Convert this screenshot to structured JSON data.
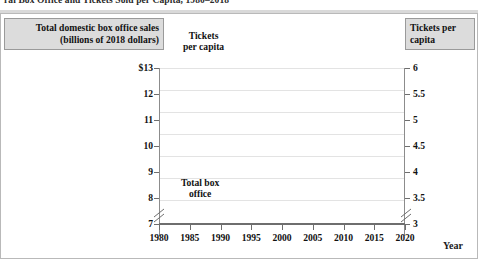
{
  "caption": {
    "text": "ral Box Office and Tickets Sold per Capita, 1980–2018"
  },
  "headers": {
    "left_line1": "Total domestic box office sales",
    "left_line2": "(billions of 2018 dollars)",
    "right_line1": "Tickets per",
    "right_line2": "capita"
  },
  "annotations": {
    "tickets_l1": "Tickets",
    "tickets_l2": "per capita",
    "boxoffice_l1": "Total box",
    "boxoffice_l2": "office"
  },
  "axes": {
    "x_title": "Year",
    "x_ticks": [
      "1980",
      "1985",
      "1990",
      "1995",
      "2000",
      "2005",
      "2010",
      "2015",
      "2020"
    ],
    "y_left_ticks": [
      "$13",
      "12",
      "11",
      "10",
      "9",
      "8",
      "7"
    ],
    "y_right_ticks": [
      "6",
      "5.5",
      "5",
      "4.5",
      "4",
      "3.5",
      "3"
    ]
  },
  "colors": {
    "tickets_series": "#808080",
    "boxoffice_series": "#b9b9b9",
    "header_fill": "#dcdcdc",
    "grid": "#e3e3e3",
    "axis": "#6e6e6e"
  },
  "chart_data": {
    "type": "line",
    "title": "ral Box Office and Tickets Sold per Capita, 1980–2018",
    "xlabel": "Year",
    "ylabel": "Total domestic box office sales (billions of 2018 dollars)",
    "y2label": "Tickets per capita",
    "xlim": [
      1980,
      2020
    ],
    "ylim": [
      7,
      13
    ],
    "y2lim": [
      3,
      6
    ],
    "grid": true,
    "legend": "in-plot annotations",
    "axis_break": "both y-axes broken below lowest tick",
    "x": [
      1980,
      1981,
      1982,
      1983,
      1984,
      1985,
      1986,
      1987,
      1988,
      1989,
      1990,
      1991,
      1992,
      1993,
      1994,
      1995,
      1996,
      1997,
      1998,
      1999,
      2000,
      2001,
      2002,
      2003,
      2004,
      2005,
      2006,
      2007,
      2008,
      2009,
      2010,
      2011,
      2012,
      2013,
      2014,
      2015,
      2016,
      2017,
      2018
    ],
    "series": [
      {
        "name": "Tickets per capita",
        "axis": "right",
        "units": "tickets per person per year",
        "color": "#808080",
        "values": [
          4.5,
          4.6,
          5.0,
          5.0,
          5.1,
          5.15,
          4.7,
          4.35,
          4.5,
          4.4,
          4.5,
          4.2,
          4.3,
          4.4,
          4.45,
          4.6,
          5.25,
          4.85,
          4.7,
          5.0,
          5.1,
          5.2,
          5.45,
          5.2,
          5.05,
          4.7,
          4.75,
          4.8,
          4.6,
          4.7,
          4.45,
          4.25,
          4.4,
          4.3,
          4.05,
          4.15,
          4.15,
          3.85,
          4.0
        ]
      },
      {
        "name": "Total box office",
        "axis": "left",
        "units": "billions of 2018 dollars",
        "color": "#b9b9b9",
        "values": [
          7.9,
          7.7,
          8.3,
          8.4,
          8.6,
          8.3,
          8.6,
          9.0,
          8.9,
          9.4,
          9.0,
          8.5,
          8.4,
          8.7,
          8.9,
          9.1,
          9.4,
          9.5,
          9.9,
          10.0,
          10.0,
          10.6,
          11.3,
          11.9,
          11.3,
          11.3,
          10.8,
          11.1,
          11.5,
          10.9,
          11.4,
          11.0,
          11.5,
          11.4,
          11.0,
          11.2,
          11.5,
          11.1,
          11.4
        ]
      }
    ]
  }
}
